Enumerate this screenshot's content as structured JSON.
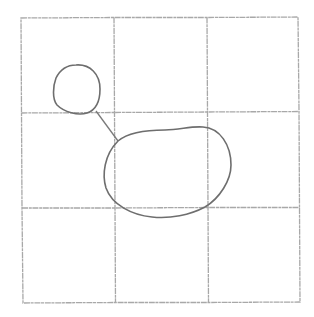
{
  "diagram": {
    "type": "pencil-sketch",
    "colors": {
      "background": "#ffffff",
      "grid": "#a8a8a8",
      "shape_stroke": "#6e6e6e"
    },
    "grid": {
      "rows": 3,
      "cols": 3,
      "bounds": {
        "left": 21,
        "top": 18,
        "right": 299,
        "bottom": 302
      },
      "vertical_lines_x": [
        21,
        114,
        207,
        299
      ],
      "horizontal_lines_y": [
        18,
        113,
        208,
        302
      ]
    },
    "shapes": [
      {
        "id": "small-circle",
        "kind": "circle",
        "cx": 77,
        "cy": 89,
        "rx": 23,
        "ry": 25
      },
      {
        "id": "large-blob",
        "kind": "blob",
        "bbox": {
          "x": 104,
          "y": 127,
          "w": 128,
          "h": 91
        }
      }
    ],
    "connector": {
      "from": [
        96,
        111
      ],
      "to": [
        118,
        141
      ]
    }
  }
}
